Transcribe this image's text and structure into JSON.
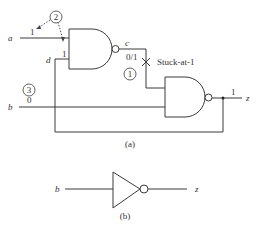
{
  "figure_a": {
    "caption": "(a)",
    "signals": {
      "a": "a",
      "b": "b",
      "c": "c",
      "d": "d",
      "z": "z"
    },
    "values": {
      "a_value": "1",
      "d_value": "1",
      "b_value": "0",
      "c_value": "0/1",
      "z_value": "1"
    },
    "fault_label": "Stuck-at-1",
    "step_markers": [
      "1",
      "2",
      "3"
    ]
  },
  "figure_b": {
    "caption": "(b)",
    "signals": {
      "b": "b",
      "z": "z"
    }
  },
  "colors": {
    "line": "#3a3a3a",
    "text": "#333333",
    "background": "#ffffff"
  }
}
